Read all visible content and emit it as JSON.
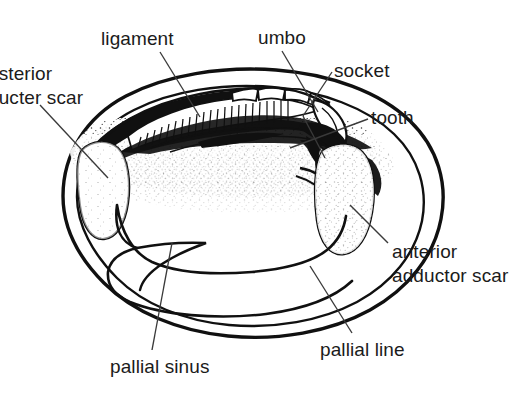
{
  "figure": {
    "kind": "anatomical-line-drawing",
    "background_color": "#ffffff",
    "ink_color": "#101010",
    "width": 516,
    "height": 402
  },
  "labels": {
    "ligament": "ligament",
    "umbo": "umbo",
    "socket": "socket",
    "tooth": "tooth",
    "posterior_adductor_scar_line1": "osterior",
    "posterior_adductor_scar_line2": "ducter scar",
    "anterior_adductor_scar_line1": "anterior",
    "anterior_adductor_scar_line2": "adductor scar",
    "pallial_sinus": "pallial sinus",
    "pallial_line": "pallial line"
  },
  "structures": [
    {
      "name": "shell-outline",
      "label": null
    },
    {
      "name": "inner-shell-margin",
      "label": null
    },
    {
      "name": "hinge-ligament-hatching",
      "label": "ligament"
    },
    {
      "name": "umbo-beak",
      "label": "umbo"
    },
    {
      "name": "hinge-socket",
      "label": "socket"
    },
    {
      "name": "hinge-tooth",
      "label": "tooth"
    },
    {
      "name": "posterior-adductor-scar",
      "label": "osterior ducter scar"
    },
    {
      "name": "anterior-adductor-scar",
      "label": "anterior adductor scar"
    },
    {
      "name": "pallial-line",
      "label": "pallial line"
    },
    {
      "name": "pallial-sinus",
      "label": "pallial sinus"
    },
    {
      "name": "stipple-shading",
      "label": null
    }
  ]
}
